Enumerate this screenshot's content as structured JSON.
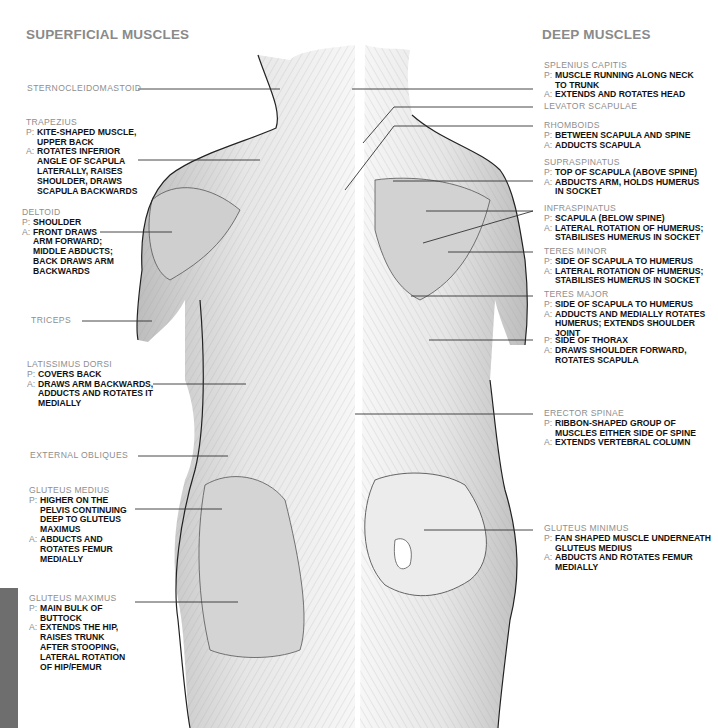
{
  "headings": {
    "superficial": "SUPERFICIAL MUSCLES",
    "deep": "DEEP MUSCLES"
  },
  "prefixes": {
    "p": "P:",
    "a": "A:"
  },
  "superficial": [
    {
      "name": "STERNOCLEIDOMASTOID",
      "p": null,
      "a": null
    },
    {
      "name": "TRAPEZIUS",
      "p": "KITE-SHAPED MUSCLE,\nUPPER BACK",
      "a": "ROTATES INFERIOR\nANGLE OF SCAPULA\nLATERALLY, RAISES\nSHOULDER, DRAWS\nSCAPULA BACKWARDS"
    },
    {
      "name": "DELTOID",
      "p": "SHOULDER",
      "a": "FRONT DRAWS\nARM FORWARD;\nMIDDLE ABDUCTS;\nBACK DRAWS ARM\nBACKWARDS"
    },
    {
      "name": "TRICEPS",
      "p": null,
      "a": null
    },
    {
      "name": "LATISSIMUS DORSI",
      "p": "COVERS BACK",
      "a": "DRAWS ARM BACKWARDS,\nADDUCTS AND ROTATES IT\nMEDIALLY"
    },
    {
      "name": "EXTERNAL OBLIQUES",
      "p": null,
      "a": null
    },
    {
      "name": "GLUTEUS MEDIUS",
      "p": "HIGHER ON THE\nPELVIS CONTINUING\nDEEP TO GLUTEUS\nMAXIMUS",
      "a": "ABDUCTS AND\nROTATES FEMUR\nMEDIALLY"
    },
    {
      "name": "GLUTEUS MAXIMUS",
      "p": "MAIN BULK OF\nBUTTOCK",
      "a": "EXTENDS THE HIP,\nRAISES TRUNK\nAFTER STOOPING,\nLATERAL ROTATION\nOF HIP/FEMUR"
    }
  ],
  "deep": [
    {
      "name": "SPLENIUS CAPITIS",
      "p": "MUSCLE RUNNING ALONG NECK\nTO TRUNK",
      "a": "EXTENDS AND ROTATES HEAD"
    },
    {
      "name": "LEVATOR SCAPULAE",
      "p": null,
      "a": null
    },
    {
      "name": "RHOMBOIDS",
      "p": "BETWEEN SCAPULA AND SPINE",
      "a": "ADDUCTS SCAPULA"
    },
    {
      "name": "SUPRASPINATUS",
      "p": "TOP OF SCAPULA (ABOVE SPINE)",
      "a": "ABDUCTS ARM, HOLDS HUMERUS\nIN SOCKET"
    },
    {
      "name": "INFRASPINATUS",
      "p": "SCAPULA (BELOW SPINE)",
      "a": "LATERAL ROTATION OF HUMERUS;\nSTABILISES HUMERUS IN SOCKET"
    },
    {
      "name": "TERES MINOR",
      "p": "SIDE OF SCAPULA TO HUMERUS",
      "a": "LATERAL ROTATION OF HUMERUS;\nSTABILISES HUMERUS IN SOCKET"
    },
    {
      "name": "TERES MAJOR",
      "p": "SIDE OF SCAPULA TO HUMERUS",
      "a": "ADDUCTS AND MEDIALLY ROTATES\nHUMERUS; EXTENDS SHOULDER JOINT"
    },
    {
      "name": "",
      "p": "SIDE OF THORAX",
      "a": "DRAWS SHOULDER FORWARD,\nROTATES SCAPULA"
    },
    {
      "name": "ERECTOR SPINAE",
      "p": "RIBBON-SHAPED GROUP OF\nMUSCLES EITHER SIDE OF SPINE",
      "a": "EXTENDS VERTEBRAL COLUMN"
    },
    {
      "name": "GLUTEUS MINIMUS",
      "p": "FAN SHAPED MUSCLE UNDERNEATH\nGLUTEUS MEDIUS",
      "a": "ABDUCTS AND ROTATES FEMUR\nMEDIALLY"
    }
  ],
  "colors": {
    "heading": "#8a8a8a",
    "name": "#8e8e8e",
    "body_text": "#111111",
    "leader_line": "#333333",
    "side_bar": "#6e6e6e"
  }
}
